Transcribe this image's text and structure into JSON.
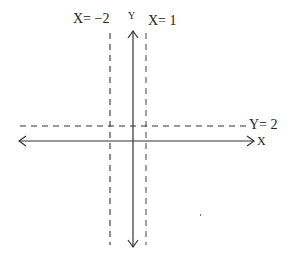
{
  "diagram": {
    "type": "coordinate-plane-sketch",
    "axes": {
      "x_label": "X",
      "y_label": "Y"
    },
    "lines": [
      {
        "label": "X= −2",
        "orientation": "vertical",
        "style": "dashed"
      },
      {
        "label": "X= 1",
        "orientation": "vertical",
        "style": "dashed"
      },
      {
        "label": "Y= 2",
        "orientation": "horizontal",
        "style": "dashed"
      }
    ],
    "colors": {
      "stroke": "#333333",
      "background": "#ffffff"
    }
  }
}
